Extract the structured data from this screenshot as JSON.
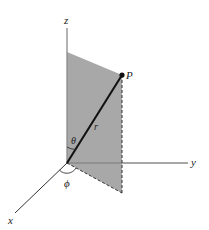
{
  "diagram": {
    "type": "spherical-coordinates",
    "labels": {
      "z_axis": "z",
      "y_axis": "y",
      "x_axis": "x",
      "point": "P",
      "radius": "r",
      "polar_angle": "θ",
      "azimuth_angle": "ϕ"
    },
    "colors": {
      "plane_fill": "#a8a8a8",
      "axis": "#888888",
      "radius_line": "#111111",
      "dashed": "#333333",
      "background": "#ffffff"
    }
  }
}
